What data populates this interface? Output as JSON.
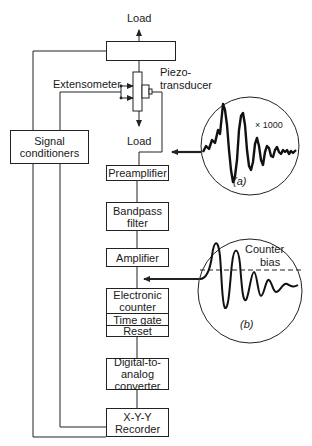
{
  "diagram": {
    "top_load_label": "Load",
    "bottom_load_label": "Load",
    "extensometer_label": "Extensometer",
    "piezo_label_line1": "Piezo-",
    "piezo_label_line2": "transducer",
    "signal_conditioners": {
      "line1": "Signal",
      "line2": "conditioners"
    },
    "blocks": {
      "preamplifier": "Preamplifier",
      "bandpass_line1": "Bandpass",
      "bandpass_line2": "filter",
      "amplifier": "Amplifier",
      "counter_line1": "Electronic",
      "counter_line2": "counter",
      "time_gate": "Time gate",
      "reset": "Reset",
      "dac_line1": "Digital-to-",
      "dac_line2": "analog",
      "dac_line3": "converter",
      "recorder_line1": "X-Y-Y",
      "recorder_line2": "Recorder"
    },
    "inset_a": {
      "magnification": "× 1000",
      "caption": "(a)"
    },
    "inset_b": {
      "annotation_line1": "Counter",
      "annotation_line2": "bias",
      "caption": "(b)"
    },
    "line_color": "#222222"
  }
}
